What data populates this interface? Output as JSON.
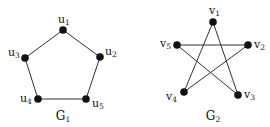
{
  "graphs": [
    {
      "name": "G",
      "subscript": "1",
      "title_pos": [
        63,
        120
      ],
      "nodes": [
        {
          "id": "u1",
          "base": "u",
          "sub": "1",
          "x": 63,
          "y": 30,
          "lx": 58,
          "ly": 23
        },
        {
          "id": "u2",
          "base": "u",
          "sub": "2",
          "x": 100,
          "y": 57,
          "lx": 105,
          "ly": 55
        },
        {
          "id": "u3",
          "base": "u",
          "sub": "3",
          "x": 25,
          "y": 58,
          "lx": 8,
          "ly": 56
        },
        {
          "id": "u4",
          "base": "u",
          "sub": "4",
          "x": 38,
          "y": 99,
          "lx": 20,
          "ly": 102
        },
        {
          "id": "u5",
          "base": "u",
          "sub": "5",
          "x": 86,
          "y": 99,
          "lx": 92,
          "ly": 107
        }
      ],
      "edges": [
        [
          "u1",
          "u2"
        ],
        [
          "u2",
          "u5"
        ],
        [
          "u5",
          "u4"
        ],
        [
          "u4",
          "u3"
        ],
        [
          "u3",
          "u1"
        ]
      ]
    },
    {
      "name": "G",
      "subscript": "2",
      "title_pos": [
        213,
        120
      ],
      "nodes": [
        {
          "id": "v1",
          "base": "v",
          "sub": "1",
          "x": 213,
          "y": 22,
          "lx": 209,
          "ly": 14
        },
        {
          "id": "v2",
          "base": "v",
          "sub": "2",
          "x": 248,
          "y": 45,
          "lx": 254,
          "ly": 48
        },
        {
          "id": "v3",
          "base": "v",
          "sub": "3",
          "x": 238,
          "y": 95,
          "lx": 244,
          "ly": 98
        },
        {
          "id": "v4",
          "base": "v",
          "sub": "4",
          "x": 184,
          "y": 92,
          "lx": 166,
          "ly": 100
        },
        {
          "id": "v5",
          "base": "v",
          "sub": "5",
          "x": 177,
          "y": 45,
          "lx": 160,
          "ly": 47
        }
      ],
      "edges": [
        [
          "v1",
          "v4"
        ],
        [
          "v1",
          "v3"
        ],
        [
          "v5",
          "v2"
        ],
        [
          "v5",
          "v3"
        ],
        [
          "v2",
          "v4"
        ]
      ]
    }
  ]
}
